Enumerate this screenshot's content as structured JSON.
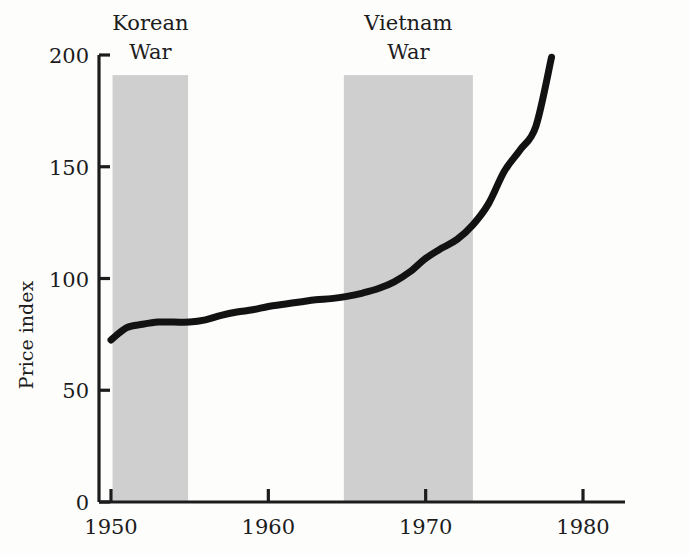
{
  "figure": {
    "background_color": "#fdfdfc",
    "ink_color": "#121212",
    "band_color": "#cfcfcf"
  },
  "axes": {
    "y_title": "Price index",
    "y_ticks": [
      "0",
      "50",
      "100",
      "150",
      "200"
    ],
    "x_ticks": [
      "1950",
      "1960",
      "1970",
      "1980"
    ]
  },
  "annotations": [
    {
      "name": "korean-war",
      "line1": "Korean",
      "line2": "War"
    },
    {
      "name": "vietnam-war",
      "line1": "Vietnam",
      "line2": "War"
    }
  ],
  "chart_data": {
    "type": "line",
    "title": "",
    "subtitle": "",
    "xlabel": "",
    "ylabel": "Price index",
    "xlim": [
      1949.2,
      1981.0
    ],
    "ylim": [
      0,
      200
    ],
    "xticks": [
      1950,
      1960,
      1970,
      1980
    ],
    "yticks": [
      0,
      50,
      100,
      150,
      200
    ],
    "grid": false,
    "legend": null,
    "series": [
      {
        "name": "Price index",
        "x": [
          1950,
          1951,
          1952,
          1953,
          1954,
          1955,
          1956,
          1957,
          1958,
          1959,
          1960,
          1961,
          1962,
          1963,
          1964,
          1965,
          1966,
          1967,
          1968,
          1969,
          1970,
          1971,
          1972,
          1973,
          1974,
          1975,
          1976,
          1977,
          1978
        ],
        "y": [
          72.5,
          78.0,
          79.5,
          80.5,
          80.5,
          80.5,
          81.5,
          83.5,
          85.0,
          86.0,
          87.5,
          88.5,
          89.5,
          90.5,
          91.0,
          92.0,
          93.5,
          95.5,
          98.5,
          103.0,
          109.0,
          113.5,
          117.5,
          124.0,
          133.5,
          148.0,
          157.5,
          168.0,
          199.0
        ]
      }
    ],
    "shaded_regions": [
      {
        "name": "Korean War",
        "label_line1": "Korean",
        "label_line2": "War",
        "x_start": 1950.1,
        "x_end": 1954.9,
        "y_top": 191,
        "color": "#cfcfcf"
      },
      {
        "name": "Vietnam War",
        "label_line1": "Vietnam",
        "label_line2": "War",
        "x_start": 1964.8,
        "x_end": 1973.0,
        "y_top": 191,
        "color": "#cfcfcf"
      }
    ]
  }
}
